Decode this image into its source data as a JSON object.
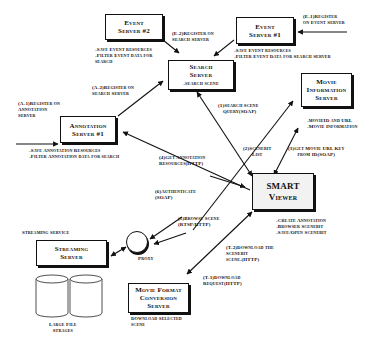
{
  "diagram": {
    "nodes": {
      "event_server_2": {
        "title_1": "Event",
        "title_2": "Server #2"
      },
      "event_server_1": {
        "title_1": "Event",
        "title_2": "Server #1"
      },
      "search_server": {
        "title_1": "Search",
        "title_2": "Server",
        "subtitle": "-search scene"
      },
      "movie_info_server": {
        "title_1": "Movie",
        "title_2": "Information",
        "title_3": "Server"
      },
      "annotation_server_1": {
        "title_1": "Annotation",
        "title_2": "Server #1"
      },
      "smart_viewer": {
        "title_1": "SMART",
        "title_2": "Viewer"
      },
      "streaming_server": {
        "title_1": "Streaming",
        "title_2": "Server"
      },
      "proxy": {
        "label": "Proxy"
      },
      "movie_format_server": {
        "title_1": "Movie Format",
        "title_2": "Conversion",
        "title_3": "Server"
      },
      "large_file_storages": {
        "label_1": "Large File",
        "label_2": "Strages"
      }
    },
    "notes": {
      "event_server_2": [
        "-Save Event resources",
        "-Filter Event data for",
        "search"
      ],
      "event_server_1": [
        "-Save Event resources",
        "-Filter Event Data for Search Server"
      ],
      "annotation_server_1": [
        "-Save Annotation Resources",
        "-Filter Annotation data for search"
      ],
      "movie_info_server": [
        "-movieID and URL",
        "-Movie Information"
      ],
      "smart_viewer": [
        "-Create Annotation",
        "-Browser Scenebit",
        "-Save/Open Scenebit"
      ],
      "streaming_service": "Streaming Service",
      "movie_format_server": [
        "Download Selected",
        "scene"
      ]
    },
    "edges": {
      "e1": [
        "(E-1)Register",
        "on Event Server"
      ],
      "e2": [
        "(E-2)Register on",
        "Search Server"
      ],
      "a1": [
        "(A-1)Register on",
        "Annotation",
        "Server"
      ],
      "a2": [
        "(A-2)Register on",
        "Search Server"
      ],
      "s1": [
        "(1)Search Scene",
        "Query(SOAP)"
      ],
      "s2": [
        "(2)Scenebit",
        "List"
      ],
      "s3": [
        "(3)Get Movie URL Key",
        "from ID(SOAP)"
      ],
      "s4": [
        "(4)Get Annotation",
        "Resources(HTTP)"
      ],
      "s5": [
        "(5)Browse Scene",
        "(RTSP/HTTP)"
      ],
      "s6": [
        "(6)Authenticate",
        "(SOAP)"
      ],
      "t1": [
        "(T-1)Download",
        "Request(HTTP)"
      ],
      "t2": [
        "(T-2)Download the",
        "Scenebit",
        "scene.(HTTP)"
      ]
    }
  }
}
